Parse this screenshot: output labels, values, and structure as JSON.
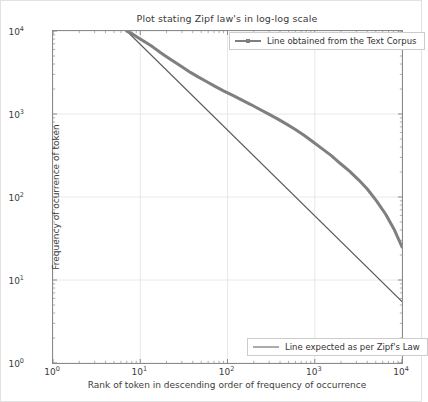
{
  "figure": {
    "title": "Plot stating Zipf law's in log-log scale",
    "background": "#ffffff",
    "frame_color": "#8a8a8a"
  },
  "axis": {
    "xlabel": "Rank of token in descending order of frequency of occurrence",
    "ylabel": "Frequency of ocurrence of token",
    "xticks": [
      "10",
      "10",
      "10",
      "10",
      "10"
    ],
    "xtick_exponents": [
      "0",
      "1",
      "2",
      "3",
      "4"
    ],
    "yticks": [
      "10",
      "10",
      "10",
      "10",
      "10"
    ],
    "ytick_exponents": [
      "0",
      "1",
      "2",
      "3",
      "4"
    ]
  },
  "legend": {
    "corpus_label": "Line obtained from the Text Corpus",
    "zipf_label": "Line expected as per Zipf's Law"
  },
  "chart_data": {
    "type": "line",
    "title": "Plot stating Zipf law's in log-log scale",
    "xlabel": "Rank of token in descending order of frequency of occurrence",
    "ylabel": "Frequency of ocurrence of token",
    "xscale": "log",
    "yscale": "log",
    "xlim": [
      1,
      10000
    ],
    "ylim": [
      1,
      10000
    ],
    "grid": true,
    "legend_position": "upper right and lower right",
    "xtick_values": [
      1,
      10,
      100,
      1000,
      10000
    ],
    "ytick_values": [
      1,
      10,
      100,
      1000,
      10000
    ],
    "series": [
      {
        "name": "Line obtained from the Text Corpus",
        "color": "#7f7f7f",
        "linewidth": 3,
        "x": [
          7,
          8,
          9,
          10,
          12,
          14,
          17,
          20,
          25,
          30,
          38,
          46,
          58,
          72,
          90,
          115,
          145,
          185,
          230,
          290,
          370,
          470,
          600,
          760,
          960,
          1200,
          1550,
          1950,
          2500,
          3200,
          4000,
          5100,
          6500,
          8200,
          10000
        ],
        "y": [
          10000,
          9300,
          8600,
          8000,
          7100,
          6400,
          5500,
          4900,
          4200,
          3700,
          3150,
          2800,
          2450,
          2150,
          1900,
          1680,
          1480,
          1300,
          1150,
          1010,
          880,
          760,
          650,
          550,
          460,
          385,
          315,
          255,
          205,
          160,
          125,
          90,
          62,
          40,
          25
        ]
      },
      {
        "name": "Line expected as per Zipf's Law",
        "color": "#5a5a5a",
        "linewidth": 1.2,
        "x": [
          7,
          10000
        ],
        "y": [
          10000,
          5.5
        ]
      }
    ]
  }
}
